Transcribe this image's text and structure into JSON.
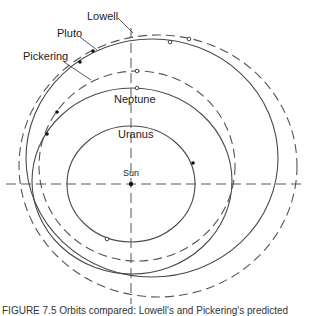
{
  "diagram": {
    "labels": {
      "lowell": "Lowell",
      "pluto": "Pluto",
      "pickering": "Pickering",
      "neptune": "Neptune",
      "uranus": "Uranus",
      "sun": "Sun"
    },
    "colors": {
      "line": "#4a4a4a",
      "background": "#ffffff",
      "text": "#222222"
    },
    "orbits": [
      {
        "name": "Uranus",
        "style": "solid",
        "cx": 131,
        "cy": 184,
        "rx": 64,
        "ry": 58
      },
      {
        "name": "Neptune",
        "style": "solid",
        "cx": 132,
        "cy": 181,
        "rx": 100,
        "ry": 93
      },
      {
        "name": "Pickering",
        "style": "dashed",
        "cx": 137,
        "cy": 166,
        "rx": 98,
        "ry": 95
      },
      {
        "name": "Pluto",
        "style": "solid",
        "cx": 152,
        "cy": 158,
        "rx": 126,
        "ry": 119
      },
      {
        "name": "Lowell",
        "style": "dashed",
        "cx": 158,
        "cy": 166,
        "rx": 139,
        "ry": 131
      }
    ],
    "caption_partial": "FIGURE 7.5 Orbits compared: Lowell's and Pickering's predicted"
  }
}
